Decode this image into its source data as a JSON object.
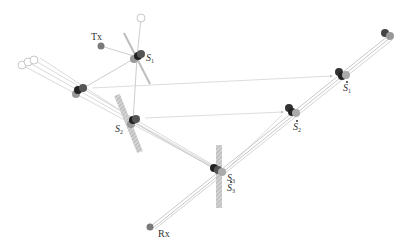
{
  "title_cutoff": "",
  "labels": {
    "tx": "Tx",
    "rx": "Rx",
    "s1": {
      "base": "S",
      "sub": "1"
    },
    "s2": {
      "base": "S",
      "sub": "2"
    },
    "s3": {
      "base": "S",
      "sub": "3"
    },
    "s3_image": {
      "base": "S",
      "sub": "3"
    },
    "s1_image": {
      "base": "S",
      "sub": "1"
    },
    "s2_image": {
      "base": "S",
      "sub": "2"
    }
  },
  "nodes": {
    "tx": {
      "x": 101,
      "y": 46,
      "color": "#777777"
    },
    "rx": {
      "x": 150,
      "y": 227,
      "color": "#777777"
    },
    "s1": {
      "x": 137,
      "y": 57
    },
    "s2": {
      "x": 133,
      "y": 122
    },
    "s3": {
      "x": 218,
      "y": 171
    },
    "s1_image": {
      "x": 342,
      "y": 75
    },
    "s2_image": {
      "x": 293,
      "y": 111
    },
    "far_image": {
      "x": 386,
      "y": 38
    },
    "left_image": {
      "x": 78,
      "y": 92
    }
  },
  "colors": {
    "dark_dot": "#3a3a3a",
    "mid_dot": "#888888",
    "light_dot": "#bbbbbb",
    "surface": "#b8b8b8",
    "ray": "#c8c8c8",
    "arrow": "#d0d0d0"
  }
}
